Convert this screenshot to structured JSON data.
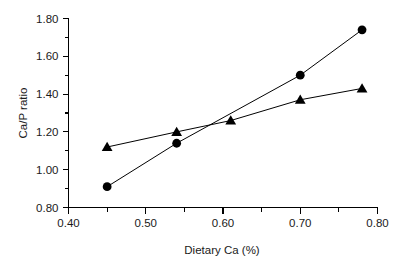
{
  "chart_data": {
    "type": "scatter",
    "title": "",
    "xlabel": "Dietary Ca (%)",
    "ylabel": "Ca/P ratio",
    "xlim": [
      0.4,
      0.8
    ],
    "ylim": [
      0.8,
      1.8
    ],
    "grid": false,
    "legend": "none",
    "x_ticks": [
      "0.40",
      "0.50",
      "0.60",
      "0.70",
      "0.80"
    ],
    "x_tick_values": [
      0.4,
      0.5,
      0.6,
      0.7,
      0.8
    ],
    "x_minor_tick_values": [
      0.45,
      0.55,
      0.65,
      0.75
    ],
    "y_ticks": [
      "0.80",
      "1.00",
      "1.20",
      "1.40",
      "1.60",
      "1.80"
    ],
    "y_tick_values": [
      0.8,
      1.0,
      1.2,
      1.4,
      1.6,
      1.8
    ],
    "y_minor_tick_values": [
      0.9,
      1.1,
      1.3,
      1.5,
      1.7
    ],
    "series": [
      {
        "name": "circle-series",
        "marker": "circle",
        "color": "#000000",
        "line": true,
        "x": [
          0.45,
          0.54,
          0.7,
          0.78
        ],
        "values": [
          0.91,
          1.14,
          1.5,
          1.74
        ]
      },
      {
        "name": "triangle-series",
        "marker": "triangle",
        "color": "#000000",
        "line": true,
        "x": [
          0.45,
          0.54,
          0.61,
          0.7,
          0.78
        ],
        "values": [
          1.12,
          1.2,
          1.26,
          1.37,
          1.43
        ]
      }
    ]
  },
  "axis": {
    "x_title": "Dietary Ca (%)",
    "y_title": "Ca/P ratio"
  }
}
